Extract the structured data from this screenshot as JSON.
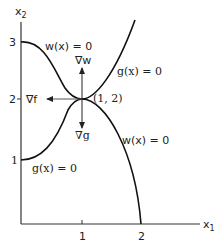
{
  "diagram": {
    "axes": {
      "x_label": "x",
      "x_sub": "1",
      "y_label": "x",
      "y_sub": "2",
      "x_ticks": [
        "1",
        "2"
      ],
      "y_ticks": [
        "1",
        "2",
        "3"
      ]
    },
    "curves": {
      "w_upper": "w(x) = 0",
      "w_lower": "w(x) = 0",
      "g_upper": "g(x) = 0",
      "g_lower": "g(x) = 0"
    },
    "point_label": "(1, 2)",
    "gradients": {
      "grad_w": "∇w",
      "grad_f": "∇f",
      "grad_g": "∇g"
    },
    "colors": {
      "curve": "#111111",
      "axis": "#333333",
      "arrow": "#555555"
    }
  }
}
